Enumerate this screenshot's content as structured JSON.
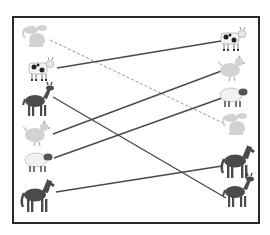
{
  "worksheet": {
    "type": "matching-exercise",
    "instruction_visible": false,
    "frame": {
      "x": 12,
      "y": 16,
      "width": 246,
      "height": 206,
      "stroke": "#2a2a2a"
    },
    "left_column": [
      {
        "id": "L1",
        "animal": "dog",
        "cx": 35,
        "cy": 36,
        "shade": "light"
      },
      {
        "id": "L2",
        "animal": "cow",
        "cx": 40,
        "cy": 68,
        "shade": "medium"
      },
      {
        "id": "L3",
        "animal": "deer",
        "cx": 37,
        "cy": 101,
        "shade": "dark"
      },
      {
        "id": "L4",
        "animal": "chicken",
        "cx": 37,
        "cy": 133,
        "shade": "light"
      },
      {
        "id": "L5",
        "animal": "sheep",
        "cx": 38,
        "cy": 160,
        "shade": "light"
      },
      {
        "id": "L6",
        "animal": "horse",
        "cx": 37,
        "cy": 195,
        "shade": "dark"
      }
    ],
    "right_column": [
      {
        "id": "R1",
        "animal": "cow",
        "cx": 232,
        "cy": 38,
        "shade": "medium"
      },
      {
        "id": "R2",
        "animal": "chicken",
        "cx": 232,
        "cy": 68,
        "shade": "light"
      },
      {
        "id": "R3",
        "animal": "sheep",
        "cx": 233,
        "cy": 95,
        "shade": "light"
      },
      {
        "id": "R4",
        "animal": "dog",
        "cx": 235,
        "cy": 124,
        "shade": "light"
      },
      {
        "id": "R5",
        "animal": "horse",
        "cx": 237,
        "cy": 161,
        "shade": "dark"
      },
      {
        "id": "R6",
        "animal": "deer",
        "cx": 237,
        "cy": 192,
        "shade": "dark"
      }
    ],
    "connections": [
      {
        "from": "L1",
        "to": "R4",
        "animal": "dog",
        "style": "dashed",
        "color": "#9a9a9a",
        "x1": 50,
        "y1": 40,
        "x2": 223,
        "y2": 123
      },
      {
        "from": "L2",
        "to": "R1",
        "animal": "cow",
        "style": "solid",
        "color": "#4a4a4a",
        "x1": 57,
        "y1": 68,
        "x2": 221,
        "y2": 41
      },
      {
        "from": "L3",
        "to": "R6",
        "animal": "deer",
        "style": "solid",
        "color": "#4a4a4a",
        "x1": 53,
        "y1": 97,
        "x2": 226,
        "y2": 198
      },
      {
        "from": "L4",
        "to": "R2",
        "animal": "chicken",
        "style": "solid",
        "color": "#4a4a4a",
        "x1": 53,
        "y1": 134,
        "x2": 224,
        "y2": 70
      },
      {
        "from": "L5",
        "to": "R3",
        "animal": "sheep",
        "style": "solid",
        "color": "#4a4a4a",
        "x1": 54,
        "y1": 158,
        "x2": 222,
        "y2": 98
      },
      {
        "from": "L6",
        "to": "R5",
        "animal": "horse",
        "style": "solid",
        "color": "#4a4a4a",
        "x1": 56,
        "y1": 192,
        "x2": 222,
        "y2": 166
      }
    ],
    "colors": {
      "dark_animal": "#4b4b4b",
      "medium_animal": "#6a6a6a",
      "light_animal": "#d2d2d2",
      "background": "#ffffff"
    }
  }
}
